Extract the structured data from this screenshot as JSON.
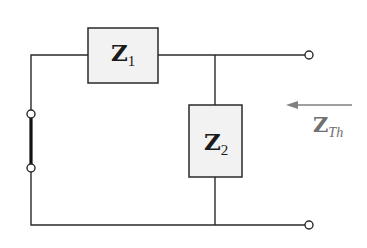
{
  "diagram": {
    "type": "circuit",
    "components": [
      {
        "id": "z1",
        "label": "Z",
        "subscript": "1",
        "kind": "impedance",
        "orientation": "series"
      },
      {
        "id": "z2",
        "label": "Z",
        "subscript": "2",
        "kind": "impedance",
        "orientation": "shunt"
      },
      {
        "id": "short",
        "kind": "short-circuit",
        "note": "source replaced by short between two terminals"
      }
    ],
    "thevenin_label": {
      "label": "Z",
      "subscript": "Th"
    },
    "colors": {
      "wire": "#2a2a2a",
      "box_fill": "#f2f2f2",
      "box_stroke": "#2a2a2a",
      "arrow": "#808080",
      "thevenin_text": "#707070"
    }
  }
}
